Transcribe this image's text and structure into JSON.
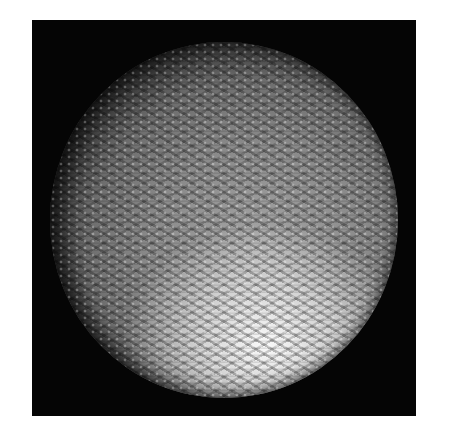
{
  "image": {
    "description": "Grayscale micrograph of a spherical object with a woven/lattice surface texture on a black background",
    "colors": {
      "page_background": "#ffffff",
      "frame_background": "#050505",
      "sphere_midtone": "#8a8a8a",
      "highlight": "#ffffff"
    },
    "highlight_region": "lower-center-right"
  }
}
